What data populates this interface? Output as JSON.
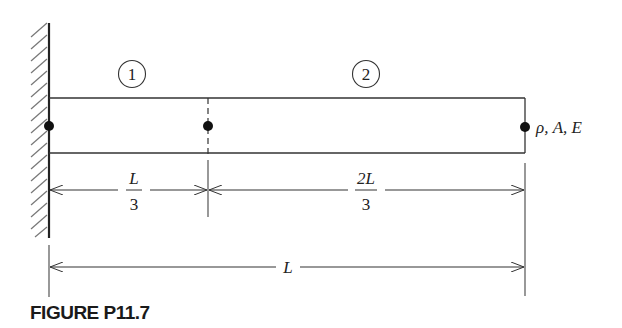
{
  "figure": {
    "caption": "FIGURE P11.7",
    "elements": [
      {
        "id": "1",
        "label": "1"
      },
      {
        "id": "2",
        "label": "2"
      }
    ],
    "properties_label": "ρ, A, E",
    "dimensions": {
      "segment1": {
        "numerator": "L",
        "denominator": "3"
      },
      "segment2": {
        "numerator": "2L",
        "denominator": "3"
      },
      "total": "L"
    },
    "nodes": [
      {
        "id": 1,
        "position": "fixed wall"
      },
      {
        "id": 2,
        "position": "L/3"
      },
      {
        "id": 3,
        "position": "L (free end)"
      }
    ],
    "support": "fixed-wall",
    "colors": {
      "line": "#333333",
      "hatch": "#777777",
      "node": "#111111"
    }
  }
}
